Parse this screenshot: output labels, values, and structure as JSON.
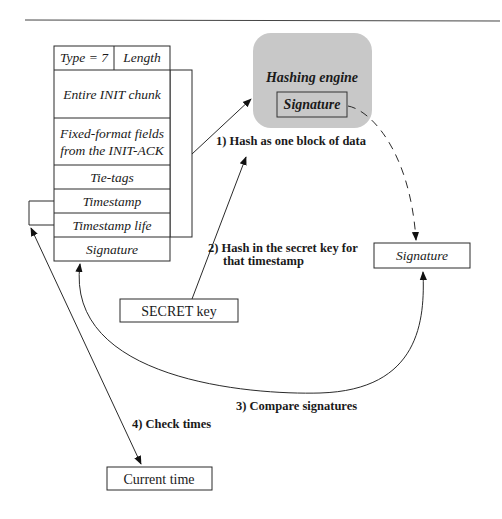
{
  "diagram": {
    "cookie_fields": {
      "type_label": "Type = 7",
      "length_label": "Length",
      "init_chunk": "Entire INIT chunk",
      "fixed_format_line1": "Fixed-format fields",
      "fixed_format_line2": "from the INIT-ACK",
      "tie_tags": "Tie-tags",
      "timestamp": "Timestamp",
      "timestamp_life": "Timestamp life",
      "signature": "Signature"
    },
    "hashing_engine": {
      "title": "Hashing engine",
      "signature": "Signature",
      "fill_color": "#c8c8c8"
    },
    "computed_signature": "Signature",
    "secret_key": "SECRET key",
    "current_time": "Current time",
    "steps": {
      "step1": "1) Hash as one block of data",
      "step2_line1": "2) Hash in the secret key for",
      "step2_line2": "that timestamp",
      "step3": "3) Compare signatures",
      "step4": "4) Check times"
    }
  }
}
